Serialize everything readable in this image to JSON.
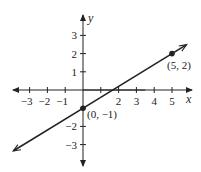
{
  "chart_data": {
    "type": "line",
    "title": "",
    "xlabel": "x",
    "ylabel": "y",
    "xlim": [
      -3.8,
      6.2
    ],
    "ylim": [
      -4.1,
      4.1
    ],
    "grid": false,
    "x_ticks": [
      -3,
      -2,
      -1,
      1,
      2,
      3,
      4,
      5
    ],
    "x_tick_labels": [
      "−3",
      "−2",
      "−1",
      "",
      "2",
      "3",
      "4",
      "5"
    ],
    "y_ticks": [
      -3,
      -2,
      -1,
      1,
      2,
      3
    ],
    "y_tick_labels": [
      "−3",
      "−2",
      "",
      "1",
      "2",
      "3"
    ],
    "series": [
      {
        "name": "line",
        "equation": "y = (3/5)x - 1",
        "x": [
          -3.9,
          5.8
        ],
        "y": [
          -3.34,
          2.48
        ],
        "arrows_both_ends": true
      }
    ],
    "points": [
      {
        "x": 0,
        "y": -1,
        "label": "(0, −1)"
      },
      {
        "x": 5,
        "y": 2,
        "label": "(5, 2)"
      }
    ]
  },
  "colors": {
    "axis": "#222222",
    "line": "#222222",
    "point": "#222222"
  }
}
